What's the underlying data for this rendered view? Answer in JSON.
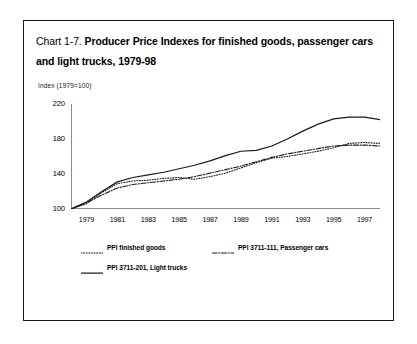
{
  "figure": {
    "title_prefix": "Chart 1-7.",
    "title_main": "Producer Price Indexes for finished goods, passenger cars and light trucks, 1979-98",
    "axis_label": "Index (1979=100)"
  },
  "chart_data": {
    "type": "line",
    "title": "Chart 1-7. Producer Price Indexes for finished goods, passenger cars and light trucks, 1979-98",
    "xlabel": "",
    "ylabel": "Index (1979=100)",
    "xlim": [
      1978,
      1998
    ],
    "ylim": [
      100,
      220
    ],
    "yticks": [
      100,
      140,
      180,
      220
    ],
    "ytick_labels": [
      "100",
      "140",
      "180",
      "220"
    ],
    "xticks": [
      1978,
      1979,
      1980,
      1981,
      1982,
      1983,
      1984,
      1985,
      1986,
      1987,
      1988,
      1989,
      1990,
      1991,
      1992,
      1993,
      1994,
      1995,
      1996,
      1997,
      1998
    ],
    "xtick_labels": [
      "1979",
      "1981",
      "1983",
      "1985",
      "1987",
      "1989",
      "1991",
      "1993",
      "1995",
      "1997"
    ],
    "xtick_label_years": [
      1979,
      1981,
      1983,
      1985,
      1987,
      1989,
      1991,
      1993,
      1995,
      1997
    ],
    "grid": false,
    "legend_position": "below",
    "x": [
      1978,
      1979,
      1980,
      1981,
      1982,
      1983,
      1984,
      1985,
      1986,
      1987,
      1988,
      1989,
      1990,
      1991,
      1992,
      1993,
      1994,
      1995,
      1996,
      1997,
      1998
    ],
    "series": [
      {
        "name": "PPI finished goods",
        "style": "dotted",
        "color": "#1a1a1a",
        "values": [
          100,
          106,
          119,
          129,
          132,
          133,
          135,
          136,
          134,
          137,
          141,
          147,
          153,
          158,
          160,
          163,
          166,
          170,
          175,
          176,
          175
        ]
      },
      {
        "name": "PPI 3711-111, Passenger cars",
        "style": "dashdot",
        "color": "#1a1a1a",
        "values": [
          100,
          107,
          116,
          124,
          128,
          130,
          132,
          134,
          137,
          141,
          145,
          149,
          154,
          159,
          163,
          166,
          169,
          172,
          173,
          173,
          172
        ]
      },
      {
        "name": "PPI 3711-201, Light trucks",
        "style": "solid",
        "color": "#1a1a1a",
        "values": [
          100,
          108,
          120,
          131,
          136,
          139,
          142,
          146,
          150,
          155,
          161,
          166,
          167,
          172,
          180,
          189,
          197,
          203,
          205,
          205,
          202
        ]
      }
    ]
  },
  "legend": {
    "entries": [
      {
        "label": "PPI finished goods",
        "style": "dotted"
      },
      {
        "label": "PPI 3711-111, Passenger cars",
        "style": "dashdot"
      },
      {
        "label": "PPI 3711-201, Light trucks",
        "style": "solid"
      }
    ]
  }
}
